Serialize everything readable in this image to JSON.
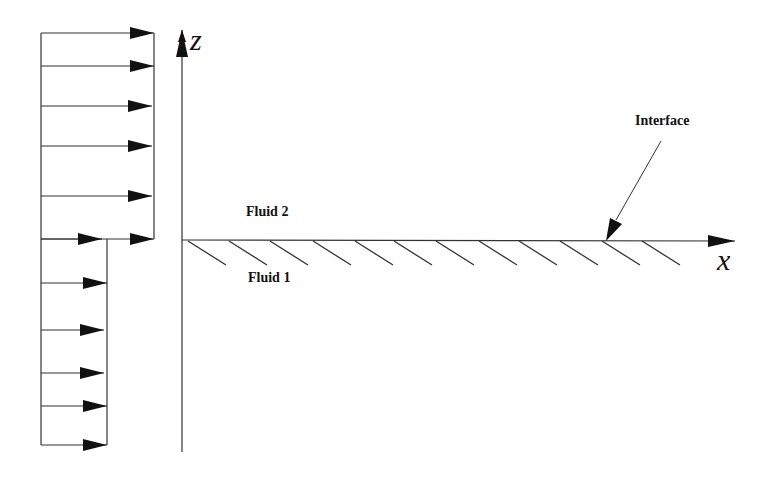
{
  "diagram": {
    "labels": {
      "fluid_upper": "Fluid 2",
      "fluid_lower": "Fluid 1",
      "interface": "Interface",
      "x_axis": "x",
      "z_axis": "z"
    },
    "velocity_profile": {
      "upper_arrows_y": [
        33,
        66,
        106,
        146,
        196,
        239
      ],
      "upper_extent_x": 154,
      "lower_arrows_y": [
        283,
        330,
        373,
        406,
        445
      ],
      "lower_extent_x": 107,
      "base_x": 41
    },
    "colors": {
      "stroke": "#222222",
      "background": "#ffffff"
    }
  }
}
